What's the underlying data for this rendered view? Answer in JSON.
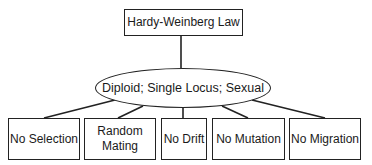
{
  "diagram": {
    "root": {
      "label": "Hardy-Weinberg Law"
    },
    "middle": {
      "label": "Diploid; Single Locus; Sexual"
    },
    "assumptions": [
      {
        "label": "No Selection"
      },
      {
        "label": "Random Mating"
      },
      {
        "label": "No Drift"
      },
      {
        "label": "No Mutation"
      },
      {
        "label": "No Migration"
      }
    ],
    "colors": {
      "stroke": "#222222",
      "background": "#ffffff",
      "text": "#1a1a1a"
    }
  }
}
